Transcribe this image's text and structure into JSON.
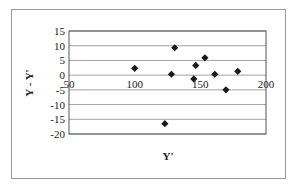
{
  "chart_data": {
    "type": "scatter",
    "title": "",
    "xlabel": "Y'",
    "ylabel": "Y - Y'",
    "xlim": [
      50,
      200
    ],
    "ylim": [
      -20,
      15
    ],
    "xticks": [
      50,
      100,
      150,
      200
    ],
    "yticks": [
      15,
      10,
      5,
      0,
      -5,
      -10,
      -15,
      -20
    ],
    "grid": "horizontal",
    "legend": "none",
    "marker": "diamond",
    "marker_color": "#1a1a1a",
    "points": [
      {
        "x": 100,
        "y": 2.3
      },
      {
        "x": 123,
        "y": -16.5
      },
      {
        "x": 128,
        "y": 0.3
      },
      {
        "x": 130.5,
        "y": 9.3
      },
      {
        "x": 145,
        "y": -1.3
      },
      {
        "x": 146.5,
        "y": 3.3
      },
      {
        "x": 153.5,
        "y": 5.9
      },
      {
        "x": 161,
        "y": 0.3
      },
      {
        "x": 169.5,
        "y": -5
      },
      {
        "x": 178.5,
        "y": 1.3
      }
    ]
  }
}
